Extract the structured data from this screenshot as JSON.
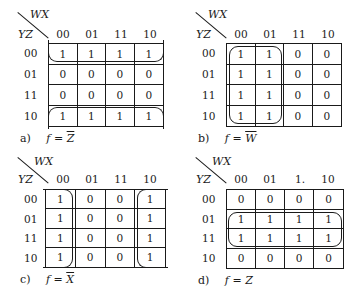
{
  "axis": {
    "wx": "WX",
    "yz": "YZ"
  },
  "col_headers": [
    "00",
    "01",
    "11",
    "10"
  ],
  "row_headers": [
    "00",
    "01",
    "11",
    "10"
  ],
  "maps": [
    {
      "id": "a",
      "caption_letter": "a)",
      "caption_lhs": "f =",
      "caption_var": "Z",
      "complemented": true,
      "col_headers": [
        "00",
        "01",
        "11",
        "10"
      ],
      "cells": [
        [
          "1",
          "1",
          "1",
          "1"
        ],
        [
          "0",
          "0",
          "0",
          "0"
        ],
        [
          "0",
          "0",
          "0",
          "0"
        ],
        [
          "1",
          "1",
          "1",
          "1"
        ]
      ],
      "grouping": "rows 00 and 10 wrap-around"
    },
    {
      "id": "b",
      "caption_letter": "b)",
      "caption_lhs": "f =",
      "caption_var": "W",
      "complemented": true,
      "col_headers": [
        "00",
        "01",
        "11",
        "10"
      ],
      "cells": [
        [
          "1",
          "1",
          "0",
          "0"
        ],
        [
          "1",
          "1",
          "0",
          "0"
        ],
        [
          "1",
          "1",
          "0",
          "0"
        ],
        [
          "1",
          "1",
          "0",
          "0"
        ]
      ],
      "grouping": "columns 00 and 01"
    },
    {
      "id": "c",
      "caption_letter": "c)",
      "caption_lhs": "f =",
      "caption_var": "X",
      "complemented": true,
      "col_headers": [
        "00",
        "01",
        "11",
        "10"
      ],
      "cells": [
        [
          "1",
          "0",
          "0",
          "1"
        ],
        [
          "1",
          "0",
          "0",
          "1"
        ],
        [
          "1",
          "0",
          "0",
          "1"
        ],
        [
          "1",
          "0",
          "0",
          "1"
        ]
      ],
      "grouping": "columns 00 and 10 wrap-around"
    },
    {
      "id": "d",
      "caption_letter": "d)",
      "caption_lhs": "f =",
      "caption_var": "Z",
      "complemented": false,
      "col_headers": [
        "00",
        "01",
        "1.",
        "10"
      ],
      "cells": [
        [
          "0",
          "0",
          "0",
          "0"
        ],
        [
          "1",
          "1",
          "1",
          "1"
        ],
        [
          "1",
          "1",
          "1",
          "1"
        ],
        [
          "0",
          "0",
          "0",
          "0"
        ]
      ],
      "grouping": "rows 01 and 11"
    }
  ]
}
